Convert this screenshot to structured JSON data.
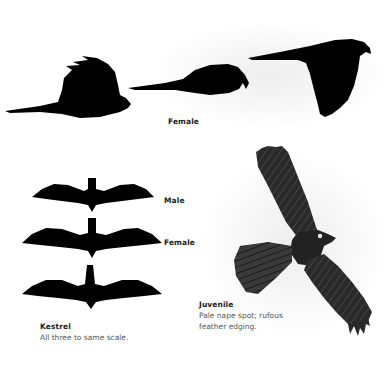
{
  "plate": {
    "top_row": {
      "label": "Female",
      "silhouettes": [
        "side-flapping",
        "side-gliding",
        "side-banking"
      ]
    },
    "left_group": {
      "labels": {
        "male": "Male",
        "female": "Female"
      },
      "title": "Kestrel",
      "caption": "All three to same scale.",
      "silhouettes": [
        "top-male",
        "top-female",
        "top-kestrel"
      ]
    },
    "juvenile": {
      "title": "Juvenile",
      "caption_line1": "Pale nape spot; rufous",
      "caption_line2": "feather edging."
    },
    "colors": {
      "silhouette": "#000000",
      "label_text": "#1a1a1a",
      "caption_text": "#555555",
      "background": "#ffffff",
      "bird_plumage": "#2a2a2a"
    }
  }
}
